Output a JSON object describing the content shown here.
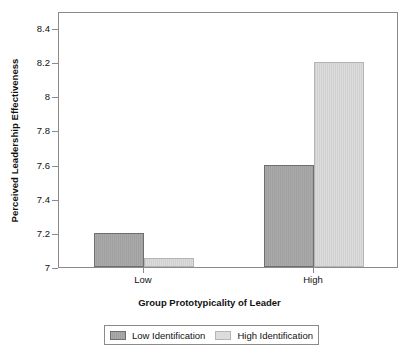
{
  "chart_data": {
    "type": "bar",
    "title": "",
    "xlabel": "Group Prototypicality of Leader",
    "ylabel": "Perceived Leadership Effectiveness",
    "categories": [
      "Low",
      "High"
    ],
    "series": [
      {
        "name": "Low Identification",
        "values": [
          7.2,
          7.6
        ],
        "color": "#a0a0a0"
      },
      {
        "name": "High Identification",
        "values": [
          7.05,
          8.2
        ],
        "color": "#dcdcdc"
      }
    ],
    "ylim": [
      7,
      8.5
    ],
    "yticks": [
      "7",
      "7.2",
      "7.4",
      "7.6",
      "7.8",
      "8",
      "8.2",
      "8.4"
    ],
    "ytick_values": [
      7,
      7.2,
      7.4,
      7.6,
      7.8,
      8,
      8.2,
      8.4
    ],
    "grid": false,
    "legend_position": "bottom"
  },
  "axes": {
    "y_title": "Perceived Leadership Effectiveness",
    "x_title": "Group Prototypicality of Leader"
  },
  "legend": {
    "items": [
      {
        "label": "Low Identification",
        "swatch": "low-id-swatch"
      },
      {
        "label": "High Identification",
        "swatch": "high-id-swatch"
      }
    ]
  }
}
